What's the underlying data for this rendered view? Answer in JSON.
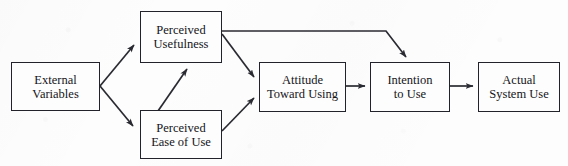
{
  "diagram": {
    "type": "flow-diagram",
    "background_color": "#fdfdfd",
    "box_border_color": "#22222a",
    "edge_color": "#2a2a32",
    "text_color": "#141419",
    "nodes": [
      {
        "id": "external-variables",
        "lines": [
          "External",
          "Variables"
        ],
        "line1": "External",
        "line2": "Variables",
        "x": 11,
        "y": 62,
        "w": 89,
        "h": 49,
        "font_size": 12.5
      },
      {
        "id": "perceived-usefulness",
        "lines": [
          "Perceived",
          "Usefulness"
        ],
        "line1": "Perceived",
        "line2": "Usefulness",
        "x": 140,
        "y": 11,
        "w": 82,
        "h": 52,
        "font_size": 12.5
      },
      {
        "id": "perceived-ease-of-use",
        "lines": [
          "Perceived",
          "Ease of Use"
        ],
        "line1": "Perceived",
        "line2": "Ease of Use",
        "x": 140,
        "y": 110,
        "w": 82,
        "h": 49,
        "font_size": 12.5
      },
      {
        "id": "attitude-toward-using",
        "lines": [
          "Attitude",
          "Toward Using"
        ],
        "line1": "Attitude",
        "line2": "Toward Using",
        "x": 259,
        "y": 62,
        "w": 87,
        "h": 50,
        "font_size": 12.5
      },
      {
        "id": "intention-to-use",
        "lines": [
          "Intention",
          "to Use"
        ],
        "line1": "Intention",
        "line2": "to Use",
        "x": 370,
        "y": 62,
        "w": 80,
        "h": 50,
        "font_size": 12.5
      },
      {
        "id": "actual-system-use",
        "lines": [
          "Actual",
          "System Use"
        ],
        "line1": "Actual",
        "line2": "System Use",
        "x": 478,
        "y": 62,
        "w": 82,
        "h": 50,
        "font_size": 12.5
      }
    ],
    "edges": [
      {
        "id": "external-to-usefulness",
        "from": "external-variables",
        "to": "perceived-usefulness"
      },
      {
        "id": "external-to-ease",
        "from": "external-variables",
        "to": "perceived-ease-of-use"
      },
      {
        "id": "ease-to-usefulness",
        "from": "perceived-ease-of-use",
        "to": "perceived-usefulness"
      },
      {
        "id": "usefulness-to-attitude",
        "from": "perceived-usefulness",
        "to": "attitude-toward-using"
      },
      {
        "id": "ease-to-attitude",
        "from": "perceived-ease-of-use",
        "to": "attitude-toward-using"
      },
      {
        "id": "usefulness-to-intention",
        "from": "perceived-usefulness",
        "to": "intention-to-use"
      },
      {
        "id": "attitude-to-intention",
        "from": "attitude-toward-using",
        "to": "intention-to-use"
      },
      {
        "id": "intention-to-actual-use",
        "from": "intention-to-use",
        "to": "actual-system-use"
      }
    ]
  }
}
